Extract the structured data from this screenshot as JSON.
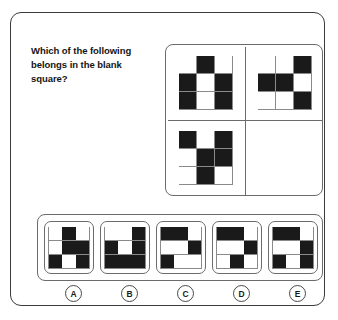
{
  "question": {
    "text": "Which of the following belongs in the blank square?"
  },
  "colors": {
    "filled_cell": "#1a1a1a",
    "empty_cell": "#ffffff",
    "grid_line": "#8a8a8a",
    "panel_border": "#6b6b6b",
    "page_border": "#3b3b3b",
    "text": "#141414"
  },
  "chart_data": {
    "type": "table",
    "title": "Which of the following belongs in the blank square?",
    "puzzle_kind": "matrix-reasoning-3x3-binary-grid",
    "legend": "1 = filled (black) cell, 0 = empty (white) cell",
    "matrix": {
      "rows": 2,
      "cols": 2,
      "cells": [
        {
          "position": "top-left",
          "blank": false,
          "grid": [
            [
              0,
              1,
              0
            ],
            [
              1,
              0,
              1
            ],
            [
              1,
              0,
              1
            ]
          ]
        },
        {
          "position": "top-right",
          "blank": false,
          "grid": [
            [
              0,
              0,
              1
            ],
            [
              1,
              1,
              0
            ],
            [
              0,
              0,
              1
            ]
          ]
        },
        {
          "position": "bottom-left",
          "blank": false,
          "grid": [
            [
              1,
              0,
              1
            ],
            [
              0,
              1,
              1
            ],
            [
              0,
              1,
              0
            ]
          ]
        },
        {
          "position": "bottom-right",
          "blank": true,
          "grid": [
            [
              0,
              0,
              0
            ],
            [
              0,
              0,
              0
            ],
            [
              0,
              0,
              0
            ]
          ]
        }
      ]
    },
    "options": [
      {
        "label": "A",
        "grid": [
          [
            0,
            1,
            0
          ],
          [
            0,
            1,
            1
          ],
          [
            1,
            0,
            1
          ]
        ]
      },
      {
        "label": "B",
        "grid": [
          [
            0,
            0,
            1
          ],
          [
            1,
            0,
            1
          ],
          [
            1,
            1,
            1
          ]
        ]
      },
      {
        "label": "C",
        "grid": [
          [
            1,
            1,
            0
          ],
          [
            0,
            0,
            1
          ],
          [
            1,
            0,
            0
          ]
        ]
      },
      {
        "label": "D",
        "grid": [
          [
            1,
            1,
            0
          ],
          [
            0,
            0,
            1
          ],
          [
            0,
            1,
            0
          ]
        ]
      },
      {
        "label": "E",
        "grid": [
          [
            1,
            1,
            0
          ],
          [
            0,
            0,
            1
          ],
          [
            1,
            0,
            1
          ]
        ]
      }
    ]
  }
}
